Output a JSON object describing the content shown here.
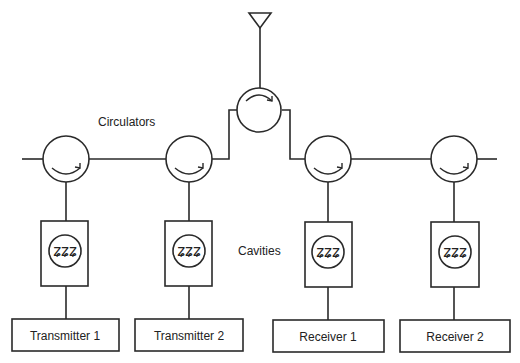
{
  "diagram": {
    "title": "",
    "labels": {
      "circulators": "Circulators",
      "cavities": "Cavities"
    },
    "antenna": {
      "icon": "antenna-icon"
    },
    "circulators": [
      {
        "id": "circulator-1",
        "icon": "circulator-icon"
      },
      {
        "id": "circulator-2",
        "icon": "circulator-icon"
      },
      {
        "id": "circulator-antenna",
        "icon": "circulator-icon"
      },
      {
        "id": "circulator-3",
        "icon": "circulator-icon"
      },
      {
        "id": "circulator-4",
        "icon": "circulator-icon"
      }
    ],
    "cavities": [
      {
        "id": "cavity-1",
        "glyph": "ʑʑʑ"
      },
      {
        "id": "cavity-2",
        "glyph": "ʑʑʑ"
      },
      {
        "id": "cavity-3",
        "glyph": "ʑʑʑ"
      },
      {
        "id": "cavity-4",
        "glyph": "ʑʑʑ"
      }
    ],
    "blocks": [
      {
        "label": "Transmitter 1"
      },
      {
        "label": "Transmitter 2"
      },
      {
        "label": "Receiver 1"
      },
      {
        "label": "Receiver 2"
      }
    ]
  }
}
